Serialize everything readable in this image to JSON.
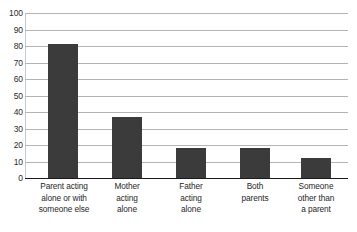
{
  "chart_data": {
    "type": "bar",
    "title": "",
    "subtitle": "",
    "xlabel": "",
    "ylabel": "",
    "ylim": [
      0,
      100
    ],
    "grid": true,
    "legend": false,
    "legend_position": "none",
    "bar_color": "#3b3b3b",
    "gridline_color": "#b4b4b4",
    "axis_color": "#1a1a1a",
    "categories": [
      "Parent acting alone or with someone else",
      "Mother acting alone",
      "Father acting alone",
      "Both parents",
      "Someone other than a parent"
    ],
    "category_lines": [
      [
        "Parent acting",
        "alone or with",
        "someone else"
      ],
      [
        "Mother",
        "acting",
        "alone"
      ],
      [
        "Father",
        "acting",
        "alone"
      ],
      [
        "Both",
        "parents"
      ],
      [
        "Someone",
        "other than",
        "a parent"
      ]
    ],
    "values": [
      81,
      37,
      18,
      18,
      12
    ],
    "yticks": [
      0,
      10,
      20,
      30,
      40,
      50,
      60,
      70,
      80,
      90,
      100
    ],
    "ytick_labels": [
      "0",
      "10",
      "20",
      "30",
      "40",
      "50",
      "60",
      "70",
      "80",
      "90",
      "100"
    ]
  }
}
